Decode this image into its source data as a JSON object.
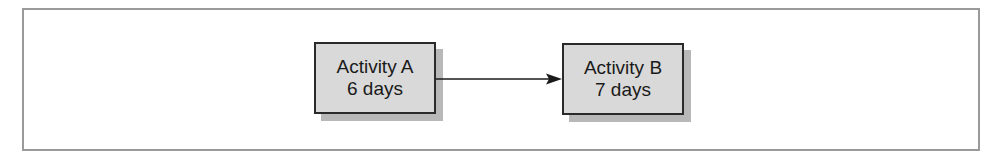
{
  "diagram": {
    "type": "activity-precedence",
    "nodes": [
      {
        "id": "A",
        "title": "Activity A",
        "duration": "6 days"
      },
      {
        "id": "B",
        "title": "Activity B",
        "duration": "7 days"
      }
    ],
    "edges": [
      {
        "from": "A",
        "to": "B"
      }
    ],
    "colors": {
      "node_fill": "#d9d9d9",
      "node_border": "#2a2a2a",
      "node_shadow": "#b8b8b8",
      "frame_border": "#9a9a9a",
      "arrow": "#1a1a1a"
    }
  }
}
